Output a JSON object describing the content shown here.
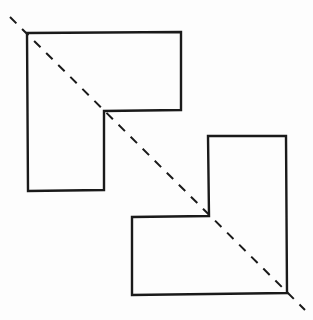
{
  "diagram": {
    "type": "symmetric-figure",
    "colors": {
      "background": "#fdfdfd",
      "stroke": "#1a1a1a",
      "axis": "#1a1a1a"
    },
    "shapes": [
      {
        "name": "upper-left-l-shape",
        "points": "27,33 181,32 181,110 104,111 104,190 28,191"
      },
      {
        "name": "lower-right-l-shape",
        "points": "208,136 286,136 287,293 132,295 132,217 209,216"
      }
    ],
    "symmetry_axis": {
      "x1": 10,
      "y1": 17,
      "x2": 305,
      "y2": 310,
      "dasharray": "9,8"
    }
  }
}
